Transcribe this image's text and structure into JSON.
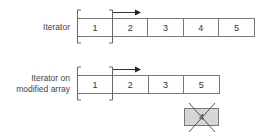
{
  "diagram": {
    "rows": [
      {
        "label_lines": [
          "Iterator"
        ],
        "cells": [
          "1",
          "2",
          "3",
          "4",
          "5"
        ]
      },
      {
        "label_lines": [
          "Iterator on",
          "modified array"
        ],
        "cells": [
          "1",
          "2",
          "3",
          "5"
        ]
      }
    ],
    "removed_element": {
      "value": "4",
      "fill": "#d6d6d6",
      "crossed_out": true
    },
    "iterator_position_index": 0,
    "arrow_direction": "right",
    "colors": {
      "line": "#777777",
      "text": "#333333",
      "removed_fill": "#d6d6d6"
    }
  }
}
